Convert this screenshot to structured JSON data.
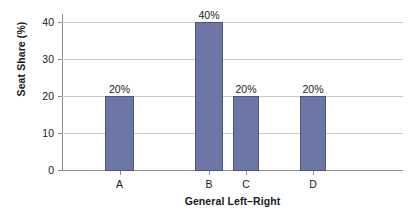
{
  "chart_data": {
    "type": "bar",
    "title": "",
    "xlabel": "General Left–Right",
    "ylabel": "Seat Share (%)",
    "categories": [
      "A",
      "B",
      "C",
      "D"
    ],
    "values": [
      20,
      40,
      20,
      20
    ],
    "value_labels": [
      "20%",
      "40%",
      "20%",
      "20%"
    ],
    "ylim": [
      0,
      44
    ],
    "ytick_labels": [
      "0",
      "10",
      "20",
      "30",
      "40"
    ],
    "ytick_values": [
      0,
      10,
      20,
      30,
      40
    ],
    "grid": "horizontal",
    "legend": "none",
    "bar_color": "#6d77a6",
    "bar_edge_color": "#4d5480",
    "axis_color": "#8c8c8c",
    "grid_color": "#c9c9c9",
    "text_color": "#1a1a1a",
    "background": "#ffffff"
  }
}
